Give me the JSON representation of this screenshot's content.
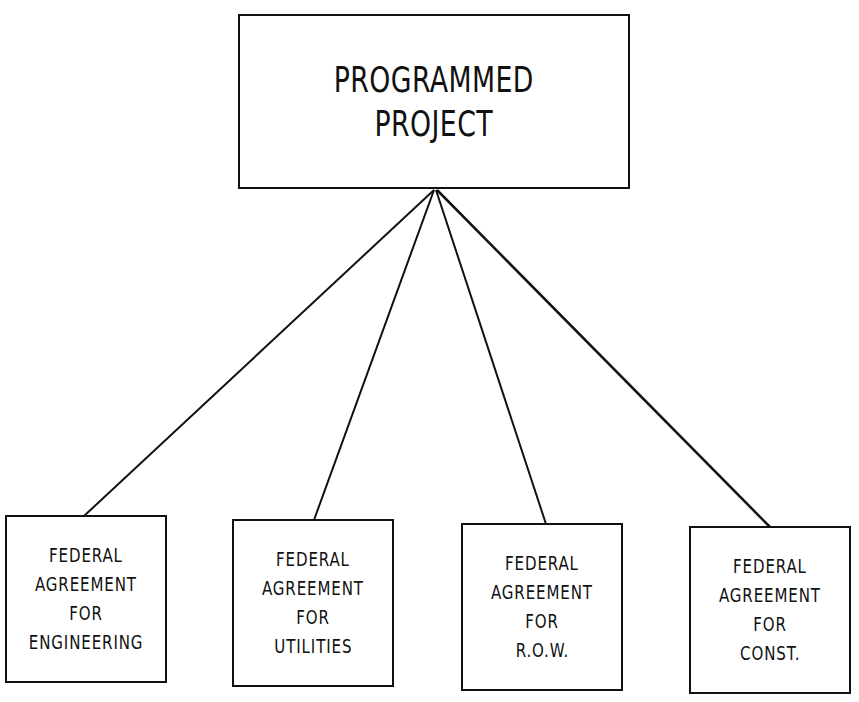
{
  "root": {
    "lines": [
      "PROGRAMMED",
      "PROJECT"
    ]
  },
  "children": [
    {
      "lines": [
        "FEDERAL",
        "AGREEMENT",
        "FOR",
        "ENGINEERING"
      ]
    },
    {
      "lines": [
        "FEDERAL",
        "AGREEMENT",
        "FOR",
        "UTILITIES"
      ]
    },
    {
      "lines": [
        "FEDERAL",
        "AGREEMENT",
        "FOR",
        "R.O.W."
      ]
    },
    {
      "lines": [
        "FEDERAL",
        "AGREEMENT",
        "FOR",
        "CONST."
      ]
    }
  ],
  "connectors": [
    {
      "from": "root",
      "to": "children.0"
    },
    {
      "from": "root",
      "to": "children.1"
    },
    {
      "from": "root",
      "to": "children.2"
    },
    {
      "from": "root",
      "to": "children.3"
    }
  ]
}
